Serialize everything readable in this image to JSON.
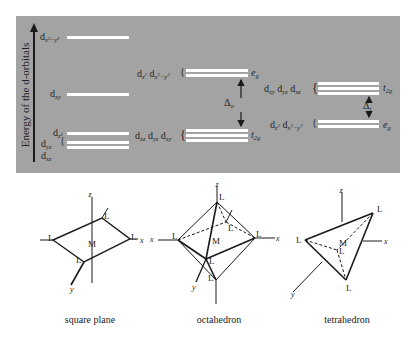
{
  "energy_diagram": {
    "axis_label": "Energy of the d-orbitals",
    "panel_color": "#a3a3a3",
    "square_planar": {
      "levels": [
        {
          "label": "d",
          "sub": "x²−y²",
          "order": 1
        },
        {
          "label": "d",
          "sub": "xy",
          "order": 2
        },
        {
          "label": "d",
          "sub": "z²",
          "order": 3
        },
        {
          "label": "d",
          "sub": "yz",
          "order": 4
        },
        {
          "label": "d",
          "sub": "xz",
          "order": 5
        }
      ]
    },
    "octahedral": {
      "upper": {
        "orbitals": "d z² d x²−y²",
        "set_label": "e",
        "set_sub": "g"
      },
      "lower": {
        "orbitals": "d xz d yz d xy",
        "set_label": "t",
        "set_sub": "2g"
      },
      "splitting": {
        "symbol": "Δ",
        "sub": "o"
      }
    },
    "tetrahedral": {
      "upper": {
        "orbitals": "d xy d yz d xz",
        "set_label": "t",
        "set_sub": "2g"
      },
      "lower": {
        "orbitals": "d z² d x²−y²",
        "set_label": "e",
        "set_sub": "g"
      },
      "splitting": {
        "symbol": "Δ",
        "sub": "t"
      }
    }
  },
  "geometries": [
    {
      "name": "square plane",
      "ligand": "L",
      "metal": "M",
      "axes": [
        "z",
        "x",
        "y"
      ]
    },
    {
      "name": "octahedron",
      "ligand": "L",
      "metal": "M",
      "axes": [
        "z",
        "x",
        "x",
        "y"
      ]
    },
    {
      "name": "tetrahedron",
      "ligand": "L",
      "metal": "M",
      "axes": [
        "z",
        "x",
        "y"
      ]
    }
  ]
}
